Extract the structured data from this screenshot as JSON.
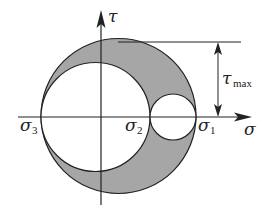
{
  "diagram": {
    "type": "mohr-circle",
    "axes": {
      "horizontal_label": "σ",
      "vertical_label": "τ"
    },
    "points": [
      {
        "symbol": "σ",
        "subscript": "3"
      },
      {
        "symbol": "σ",
        "subscript": "2"
      },
      {
        "symbol": "σ",
        "subscript": "1"
      }
    ],
    "dimension": {
      "symbol": "τ",
      "subscript": "max"
    },
    "colors": {
      "shaded_region": "#a6a6a6",
      "lines": "#222222",
      "background": "#ffffff"
    }
  }
}
